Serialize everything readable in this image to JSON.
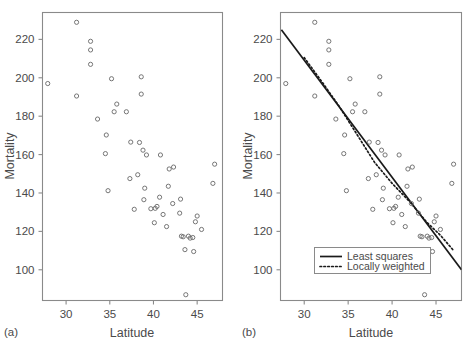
{
  "figure": {
    "panel_a_label": "(a)",
    "panel_b_label": "(b)"
  },
  "chart_data": [
    {
      "type": "scatter",
      "panel": "(a)",
      "title": "",
      "xlabel": "Latitude",
      "ylabel": "Mortality",
      "xlim": [
        27.3,
        47.9
      ],
      "ylim": [
        84,
        234
      ],
      "xticks": [
        30,
        35,
        40,
        45
      ],
      "yticks": [
        100,
        120,
        140,
        160,
        180,
        200,
        220
      ],
      "grid": false,
      "legend": null,
      "x": [
        27.9,
        31.2,
        31.2,
        32.8,
        32.8,
        32.8,
        33.6,
        34.5,
        34.6,
        34.8,
        35.2,
        35.5,
        35.8,
        36.9,
        37.3,
        37.4,
        37.8,
        38.2,
        38.4,
        38.6,
        38.6,
        38.8,
        38.9,
        39.0,
        39.2,
        39.7,
        40.1,
        40.2,
        40.4,
        40.7,
        40.8,
        41.1,
        41.5,
        41.7,
        41.8,
        42.2,
        42.3,
        43.0,
        43.1,
        43.2,
        43.4,
        43.6,
        43.7,
        44.0,
        44.2,
        44.5,
        44.6,
        44.8,
        45.0,
        45.5,
        46.8,
        47.0
      ],
      "y": [
        197.0,
        228.9,
        190.5,
        219.0,
        214.5,
        207.0,
        178.5,
        160.5,
        170.2,
        141.2,
        199.5,
        182.3,
        186.3,
        182.3,
        147.5,
        166.5,
        131.5,
        149.5,
        166.3,
        200.5,
        191.5,
        162.3,
        136.5,
        142.5,
        159.8,
        131.8,
        124.5,
        132.0,
        133.0,
        137.8,
        159.8,
        128.8,
        122.5,
        143.5,
        152.5,
        134.5,
        153.5,
        129.5,
        136.8,
        117.5,
        117.2,
        110.5,
        87.0,
        117.5,
        116.5,
        116.8,
        109.5,
        125.0,
        128.0,
        121.0,
        145.0,
        155.0
      ],
      "point_marker": "open-circle",
      "note": "Mortality versus latitude scatter, no fitted curves"
    },
    {
      "type": "scatter",
      "panel": "(b)",
      "title": "",
      "xlabel": "Latitude",
      "ylabel": "Mortality",
      "xlim": [
        27.3,
        47.9
      ],
      "ylim": [
        84,
        234
      ],
      "xticks": [
        30,
        35,
        40,
        45
      ],
      "yticks": [
        100,
        120,
        140,
        160,
        180,
        200,
        220
      ],
      "grid": false,
      "x": [
        27.9,
        31.2,
        31.2,
        32.8,
        32.8,
        32.8,
        33.6,
        34.5,
        34.6,
        34.8,
        35.2,
        35.5,
        35.8,
        36.9,
        37.3,
        37.4,
        37.8,
        38.2,
        38.4,
        38.6,
        38.6,
        38.8,
        38.9,
        39.0,
        39.2,
        39.7,
        40.1,
        40.2,
        40.4,
        40.7,
        40.8,
        41.1,
        41.5,
        41.7,
        41.8,
        42.2,
        42.3,
        43.0,
        43.1,
        43.2,
        43.4,
        43.6,
        43.7,
        44.0,
        44.2,
        44.5,
        44.6,
        44.8,
        45.0,
        45.5,
        46.8,
        47.0
      ],
      "y": [
        197.0,
        228.9,
        190.5,
        219.0,
        214.5,
        207.0,
        178.5,
        160.5,
        170.2,
        141.2,
        199.5,
        182.3,
        186.3,
        182.3,
        147.5,
        166.5,
        131.5,
        149.5,
        166.3,
        200.5,
        191.5,
        162.3,
        136.5,
        142.5,
        159.8,
        131.8,
        124.5,
        132.0,
        133.0,
        137.8,
        159.8,
        128.8,
        122.5,
        143.5,
        152.5,
        134.5,
        153.5,
        129.5,
        136.8,
        117.5,
        117.2,
        110.5,
        87.0,
        117.5,
        116.5,
        116.8,
        109.5,
        125.0,
        128.0,
        121.0,
        145.0,
        155.0
      ],
      "point_marker": "open-circle",
      "series": [
        {
          "name": "Least squares",
          "style": "solid",
          "x": [
            27.4,
            47.9
          ],
          "y": [
            225.0,
            100.0
          ]
        },
        {
          "name": "Locally weighted",
          "style": "dotted",
          "x": [
            30.0,
            32.0,
            34.0,
            36.0,
            38.0,
            40.0,
            42.0,
            44.0,
            45.5,
            47.0
          ],
          "y": [
            210.5,
            198.0,
            185.0,
            170.5,
            156.0,
            145.0,
            135.5,
            124.5,
            118.0,
            110.0
          ]
        }
      ],
      "legend": {
        "position": "bottom-left-inside",
        "entries": [
          {
            "label": "Least squares",
            "style": "solid"
          },
          {
            "label": "Locally weighted",
            "style": "dotted"
          }
        ]
      }
    }
  ]
}
